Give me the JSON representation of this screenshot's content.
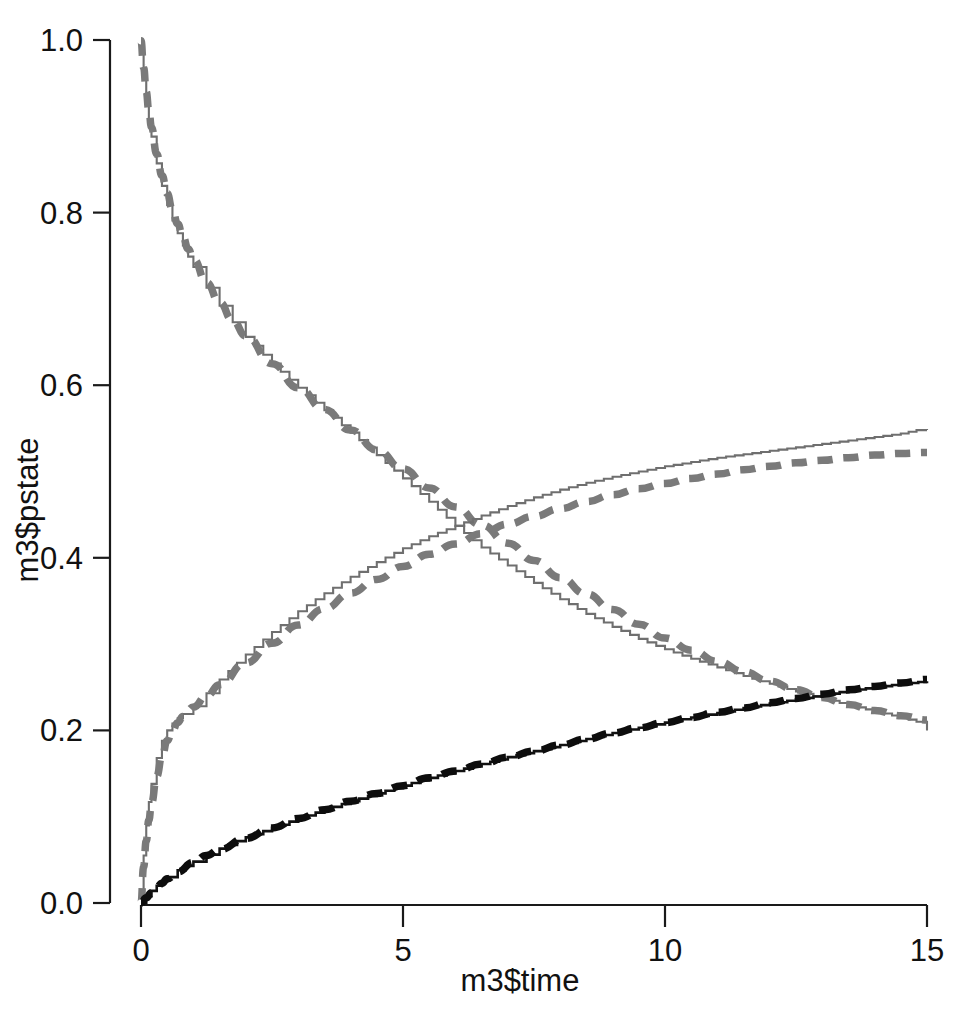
{
  "chart_data": {
    "type": "line",
    "title": "",
    "subtitle": "",
    "xlabel": "m3$time",
    "ylabel": "m3$pstate",
    "xlim": [
      0,
      15
    ],
    "ylim": [
      0.0,
      1.0
    ],
    "xticks": [
      0,
      5,
      10,
      15
    ],
    "xtick_labels": [
      "0",
      "5",
      "10",
      "15"
    ],
    "yticks": [
      0.0,
      0.2,
      0.4,
      0.6,
      0.8,
      1.0
    ],
    "ytick_labels": [
      "0.0",
      "0.2",
      "0.4",
      "0.6",
      "0.8",
      "1.0"
    ],
    "grid": false,
    "legend": "none",
    "colors": {
      "gray": "#6f6f6f",
      "black": "#111111",
      "axis": "#1a1a1a",
      "background": "#ffffff"
    },
    "series": [
      {
        "name": "state 1 empirical (gray step, decreasing)",
        "style": "solid",
        "color": "#6f6f6f",
        "x": [
          0.0,
          0.05,
          0.1,
          0.15,
          0.2,
          0.3,
          0.4,
          0.5,
          0.6,
          0.7,
          0.8,
          0.9,
          1.0,
          1.25,
          1.5,
          1.75,
          2.0,
          2.5,
          3.0,
          3.5,
          4.0,
          4.5,
          5.0,
          5.5,
          6.0,
          6.5,
          7.0,
          7.5,
          8.0,
          8.5,
          9.0,
          9.5,
          10.0,
          10.5,
          11.0,
          11.5,
          12.0,
          12.5,
          13.0,
          13.5,
          14.0,
          14.5,
          14.8,
          15.0
        ],
        "y": [
          0.998,
          0.962,
          0.932,
          0.908,
          0.888,
          0.857,
          0.831,
          0.809,
          0.791,
          0.776,
          0.762,
          0.749,
          0.737,
          0.713,
          0.692,
          0.673,
          0.656,
          0.625,
          0.597,
          0.571,
          0.545,
          0.519,
          0.492,
          0.465,
          0.437,
          0.412,
          0.391,
          0.371,
          0.352,
          0.335,
          0.32,
          0.306,
          0.294,
          0.283,
          0.273,
          0.263,
          0.254,
          0.245,
          0.237,
          0.229,
          0.222,
          0.215,
          0.21,
          0.2
        ]
      },
      {
        "name": "state 1 fitted (gray dashed, decreasing)",
        "style": "dashed",
        "color": "#7a7a7a",
        "x": [
          0.0,
          0.05,
          0.1,
          0.15,
          0.2,
          0.3,
          0.4,
          0.5,
          0.6,
          0.7,
          0.8,
          0.9,
          1.0,
          1.25,
          1.5,
          1.75,
          2.0,
          2.5,
          3.0,
          3.5,
          4.0,
          4.5,
          5.0,
          5.5,
          6.0,
          6.5,
          7.0,
          7.5,
          8.0,
          8.5,
          9.0,
          9.5,
          10.0,
          10.5,
          11.0,
          11.5,
          12.0,
          12.5,
          13.0,
          13.5,
          14.0,
          14.5,
          15.0
        ],
        "y": [
          0.999,
          0.968,
          0.94,
          0.918,
          0.899,
          0.868,
          0.843,
          0.822,
          0.803,
          0.787,
          0.772,
          0.758,
          0.746,
          0.719,
          0.696,
          0.675,
          0.657,
          0.625,
          0.597,
          0.572,
          0.548,
          0.525,
          0.503,
          0.481,
          0.459,
          0.438,
          0.417,
          0.397,
          0.377,
          0.358,
          0.34,
          0.323,
          0.307,
          0.293,
          0.28,
          0.268,
          0.257,
          0.247,
          0.238,
          0.23,
          0.223,
          0.217,
          0.212
        ]
      },
      {
        "name": "state 2 empirical (gray step, increasing)",
        "style": "solid",
        "color": "#6f6f6f",
        "x": [
          0.0,
          0.05,
          0.1,
          0.15,
          0.2,
          0.3,
          0.4,
          0.5,
          0.6,
          0.7,
          0.8,
          1.0,
          1.25,
          1.5,
          2.0,
          2.5,
          3.0,
          3.5,
          4.0,
          4.5,
          5.0,
          5.5,
          6.0,
          6.5,
          7.0,
          7.5,
          8.0,
          8.5,
          9.0,
          9.5,
          10.0,
          10.5,
          11.0,
          11.5,
          12.0,
          12.5,
          13.0,
          13.5,
          14.0,
          14.5,
          14.8,
          15.0
        ],
        "y": [
          0.0,
          0.055,
          0.09,
          0.117,
          0.138,
          0.168,
          0.188,
          0.2,
          0.208,
          0.214,
          0.219,
          0.228,
          0.243,
          0.259,
          0.288,
          0.314,
          0.338,
          0.359,
          0.378,
          0.395,
          0.411,
          0.425,
          0.437,
          0.449,
          0.46,
          0.47,
          0.479,
          0.487,
          0.494,
          0.5,
          0.506,
          0.511,
          0.516,
          0.52,
          0.524,
          0.528,
          0.532,
          0.536,
          0.54,
          0.544,
          0.548,
          0.548
        ]
      },
      {
        "name": "state 2 fitted (gray dashed, increasing)",
        "style": "dashed",
        "color": "#7a7a7a",
        "x": [
          0.0,
          0.05,
          0.1,
          0.15,
          0.2,
          0.3,
          0.4,
          0.5,
          0.6,
          0.7,
          0.8,
          1.0,
          1.25,
          1.5,
          2.0,
          2.5,
          3.0,
          3.5,
          4.0,
          4.5,
          5.0,
          5.5,
          6.0,
          6.5,
          7.0,
          7.5,
          8.0,
          8.5,
          9.0,
          9.5,
          10.0,
          10.5,
          11.0,
          11.5,
          12.0,
          12.5,
          13.0,
          13.5,
          14.0,
          14.5,
          15.0
        ],
        "y": [
          0.0,
          0.042,
          0.072,
          0.096,
          0.116,
          0.147,
          0.17,
          0.188,
          0.2,
          0.209,
          0.216,
          0.227,
          0.24,
          0.253,
          0.278,
          0.301,
          0.322,
          0.341,
          0.359,
          0.375,
          0.39,
          0.404,
          0.416,
          0.428,
          0.439,
          0.448,
          0.457,
          0.465,
          0.473,
          0.48,
          0.486,
          0.492,
          0.497,
          0.502,
          0.506,
          0.51,
          0.513,
          0.516,
          0.519,
          0.521,
          0.522
        ]
      },
      {
        "name": "state 3 empirical (black, increasing)",
        "style": "solid",
        "color": "#111111",
        "x": [
          0.0,
          0.1,
          0.2,
          0.3,
          0.4,
          0.5,
          0.7,
          1.0,
          1.25,
          1.5,
          2.0,
          2.5,
          3.0,
          3.5,
          4.0,
          4.5,
          5.0,
          5.5,
          6.0,
          6.5,
          7.0,
          7.5,
          8.0,
          8.5,
          9.0,
          9.5,
          10.0,
          10.5,
          11.0,
          11.5,
          12.0,
          12.5,
          13.0,
          13.5,
          14.0,
          14.5,
          15.0
        ],
        "y": [
          0.0,
          0.008,
          0.014,
          0.02,
          0.025,
          0.03,
          0.038,
          0.048,
          0.056,
          0.063,
          0.076,
          0.087,
          0.098,
          0.108,
          0.118,
          0.127,
          0.136,
          0.145,
          0.153,
          0.161,
          0.169,
          0.176,
          0.183,
          0.19,
          0.197,
          0.203,
          0.209,
          0.215,
          0.22,
          0.226,
          0.231,
          0.236,
          0.241,
          0.246,
          0.25,
          0.254,
          0.257
        ]
      },
      {
        "name": "state 3 fitted (black dashed, increasing)",
        "style": "dashed",
        "color": "#0d0d0d",
        "x": [
          0.0,
          0.1,
          0.2,
          0.3,
          0.4,
          0.5,
          0.7,
          1.0,
          1.25,
          1.5,
          2.0,
          2.5,
          3.0,
          3.5,
          4.0,
          4.5,
          5.0,
          5.5,
          6.0,
          6.5,
          7.0,
          7.5,
          8.0,
          8.5,
          9.0,
          9.5,
          10.0,
          10.5,
          11.0,
          11.5,
          12.0,
          12.5,
          13.0,
          13.5,
          14.0,
          14.5,
          15.0
        ],
        "y": [
          0.0,
          0.006,
          0.012,
          0.018,
          0.023,
          0.028,
          0.036,
          0.047,
          0.055,
          0.062,
          0.075,
          0.087,
          0.098,
          0.108,
          0.118,
          0.127,
          0.136,
          0.145,
          0.153,
          0.161,
          0.169,
          0.176,
          0.183,
          0.19,
          0.197,
          0.203,
          0.209,
          0.215,
          0.221,
          0.226,
          0.232,
          0.237,
          0.242,
          0.247,
          0.251,
          0.255,
          0.259
        ]
      }
    ],
    "annotations": []
  }
}
